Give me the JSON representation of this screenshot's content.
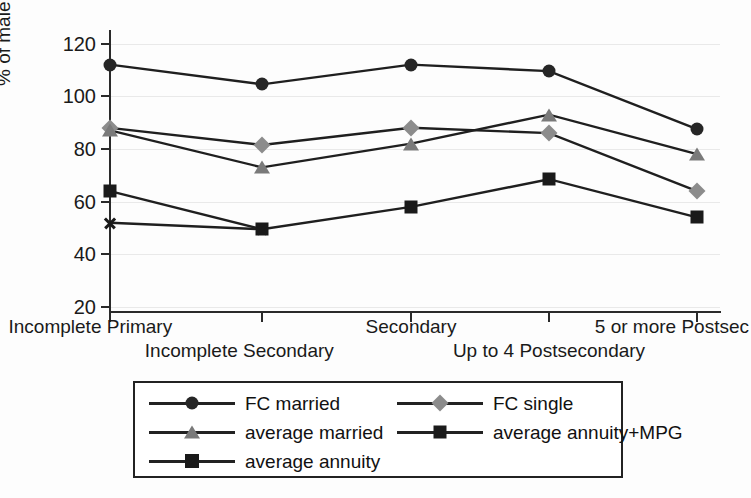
{
  "chart_data": {
    "type": "line",
    "title": "",
    "xlabel": "",
    "ylabel": "% of male EPV at 65",
    "categories": [
      "Incomplete Primary",
      "Incomplete Secondary",
      "Secondary",
      "Up to 4 Postsecondary",
      "5 or more Postsec"
    ],
    "ylim": [
      20,
      120
    ],
    "yticks": [
      20,
      40,
      60,
      80,
      100,
      120
    ],
    "ytick_labels": [
      "20",
      "40",
      "60",
      "80",
      "100",
      "120"
    ],
    "grid": true,
    "legend_position": "below-plot",
    "series": [
      {
        "name": "FC married",
        "marker": "circle",
        "color": "#262626",
        "values": [
          112,
          104.5,
          112,
          109.5,
          87.5
        ]
      },
      {
        "name": "FC single",
        "marker": "diamond",
        "color": "#8c8c8c",
        "values": [
          88,
          81.5,
          88,
          86,
          64
        ]
      },
      {
        "name": "average married",
        "marker": "triangle",
        "color": "#7a7a7a",
        "values": [
          87,
          73,
          82,
          93,
          78
        ]
      },
      {
        "name": "average annuity+MPG",
        "marker": "square",
        "color": "#1a1a1a",
        "values": [
          64,
          49.5,
          58,
          68.5,
          54
        ]
      },
      {
        "name": "average annuity",
        "marker": "cross",
        "color": "#1a1a1a",
        "values": [
          52,
          49.5,
          null,
          null,
          null
        ]
      }
    ]
  },
  "legend": {
    "entries": [
      {
        "label": "FC married",
        "marker": "circle"
      },
      {
        "label": "FC single",
        "marker": "diamond"
      },
      {
        "label": "average married",
        "marker": "triangle"
      },
      {
        "label": "average annuity+MPG",
        "marker": "square"
      },
      {
        "label": "average annuity",
        "marker": "cross"
      }
    ]
  }
}
